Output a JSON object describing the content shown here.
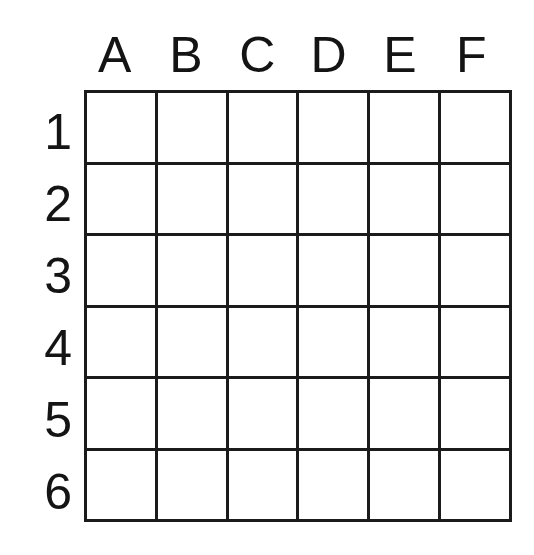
{
  "figure": {
    "background_color": "#ffffff",
    "line_color": "#1b1b1b",
    "text_color": "#141414"
  },
  "grid": {
    "columns": 6,
    "rows": 6,
    "column_headers": [
      "A",
      "B",
      "C",
      "D",
      "E",
      "F"
    ],
    "row_labels": [
      "1",
      "2",
      "3",
      "4",
      "5",
      "6"
    ],
    "cells": [
      [
        "",
        "",
        "",
        "",
        "",
        ""
      ],
      [
        "",
        "",
        "",
        "",
        "",
        ""
      ],
      [
        "",
        "",
        "",
        "",
        "",
        ""
      ],
      [
        "",
        "",
        "",
        "",
        "",
        ""
      ],
      [
        "",
        "",
        "",
        "",
        "",
        ""
      ],
      [
        "",
        "",
        "",
        "",
        "",
        ""
      ]
    ]
  }
}
